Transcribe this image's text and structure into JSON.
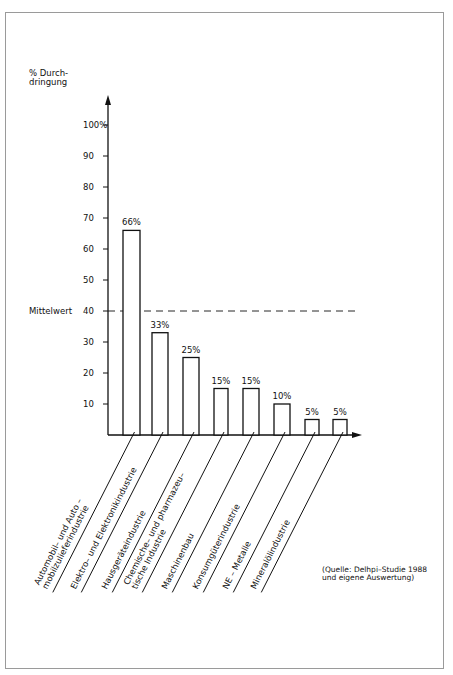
{
  "chart_data": {
    "type": "bar",
    "title": "",
    "ylabel": "% Durchdringung",
    "ylabel_lines": [
      "% Durch-",
      "dringung"
    ],
    "xlabel": "",
    "ylim": [
      0,
      100
    ],
    "yticks": [
      "10",
      "20",
      "30",
      "40",
      "50",
      "60",
      "70",
      "80",
      "90",
      "100%"
    ],
    "grid": false,
    "categories": [
      "Automobil- und Auto-mobilzulieferindustrie",
      "Elektro- und Elektronikindustrie",
      "Hausgeräteindustrie",
      "Chemische- und pharmazeutische Industrie",
      "Maschinenbau",
      "Konsumgüterindustrie",
      "NE - Metalle",
      "Mineralölindustrie"
    ],
    "category_lines": [
      [
        "Automobil– und Auto –",
        "mobilzulieferindustrie"
      ],
      [
        "Elektro– und Elektronikindustrie"
      ],
      [
        "Hausgeräteindustrie"
      ],
      [
        "Chemische– und pharmazeu–",
        "tische Industrie"
      ],
      [
        "Maschinenbau"
      ],
      [
        "Konsumgüterindustrie"
      ],
      [
        "NE – Metalle"
      ],
      [
        "Mineralölindustrie"
      ]
    ],
    "values": [
      66,
      33,
      25,
      15,
      15,
      10,
      5,
      5
    ],
    "value_labels": [
      "66%",
      "33%",
      "25%",
      "15%",
      "15%",
      "10%",
      "5%",
      "5%"
    ],
    "reference_line": {
      "label": "Mittelwert",
      "value": 40,
      "style": "dashed"
    },
    "annotation": [
      "(Quelle: Delhpi–Studie 1988",
      "und eigene Auswertung)"
    ]
  },
  "colors": {
    "ink": "#111111",
    "frame": "#9a9a9a",
    "bar_fill": "#ffffff"
  }
}
